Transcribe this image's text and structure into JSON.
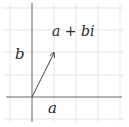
{
  "diagram": {
    "grid": {
      "x": [
        10,
        32,
        54,
        76,
        98,
        120
      ],
      "y": [
        8,
        30,
        52,
        75,
        97,
        119
      ],
      "color": "#e6e6e6"
    },
    "axes": {
      "origin_x": 32,
      "origin_y": 97,
      "color": "#555555"
    },
    "vector": {
      "from": [
        32,
        97
      ],
      "to": [
        54,
        52
      ],
      "color": "#444444"
    },
    "labels": {
      "point": "a + bi",
      "imag_component": "b",
      "real_component": "a"
    }
  }
}
